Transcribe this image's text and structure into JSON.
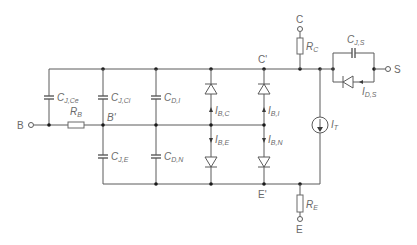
{
  "diagram": {
    "type": "circuit-schematic",
    "terminals": {
      "base": "B",
      "collector": "C",
      "emitter": "E",
      "substrate": "S"
    },
    "nodes": {
      "inner_base": "B'",
      "inner_collector": "C'",
      "inner_emitter": "E'"
    },
    "components": {
      "rb": {
        "main": "R",
        "sub": "B"
      },
      "rc": {
        "main": "R",
        "sub": "C"
      },
      "re": {
        "main": "R",
        "sub": "E"
      },
      "cjce": {
        "main": "C",
        "sub": "J,Ce"
      },
      "cjci": {
        "main": "C",
        "sub": "J,Ci"
      },
      "cdi": {
        "main": "C",
        "sub": "D,I"
      },
      "cje": {
        "main": "C",
        "sub": "J,E"
      },
      "cdn": {
        "main": "C",
        "sub": "D,N"
      },
      "cjs": {
        "main": "C",
        "sub": "J,S"
      },
      "ibc": {
        "main": "I",
        "sub": "B,C"
      },
      "ibi": {
        "main": "I",
        "sub": "B,I"
      },
      "ibe": {
        "main": "I",
        "sub": "B,E"
      },
      "ibn": {
        "main": "I",
        "sub": "B,N"
      },
      "it": {
        "main": "I",
        "sub": "T"
      },
      "ids": {
        "main": "I",
        "sub": "D,S"
      }
    }
  }
}
